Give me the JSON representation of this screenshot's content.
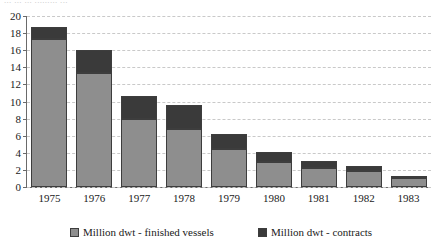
{
  "caption_fragment": "... ... ... ......... ...",
  "chart_data": {
    "type": "bar",
    "stacked": true,
    "title": "",
    "subtitle": "",
    "xlabel": "",
    "ylabel": "",
    "categories": [
      "1975",
      "1976",
      "1977",
      "1978",
      "1979",
      "1980",
      "1981",
      "1982",
      "1983"
    ],
    "series": [
      {
        "name": "Million dwt - finished vessels",
        "color": "#8e8e8e",
        "values": [
          17.3,
          13.3,
          8.0,
          6.8,
          4.4,
          2.9,
          2.2,
          1.9,
          1.0
        ]
      },
      {
        "name": "Million dwt - contracts",
        "color": "#3a3a3a",
        "values": [
          1.4,
          2.7,
          2.7,
          2.8,
          1.8,
          1.2,
          0.8,
          0.6,
          0.2
        ]
      }
    ],
    "totals": [
      18.7,
      16.0,
      10.7,
      9.6,
      6.2,
      4.1,
      3.0,
      2.5,
      1.2
    ],
    "ylim": [
      0,
      20
    ],
    "yticks": [
      0,
      2,
      4,
      6,
      8,
      10,
      12,
      14,
      16,
      18,
      20
    ],
    "ytick_labels": [
      "0",
      "2",
      "4",
      "6",
      "8",
      "10",
      "12",
      "14",
      "16",
      "18",
      "20"
    ],
    "grid": true,
    "grid_style": "dashed-horizontal",
    "legend_position": "bottom"
  },
  "legend": {
    "items": [
      {
        "label": "Million dwt - finished vessels",
        "color": "#8e8e8e"
      },
      {
        "label": "Million dwt - contracts",
        "color": "#3a3a3a"
      }
    ]
  }
}
